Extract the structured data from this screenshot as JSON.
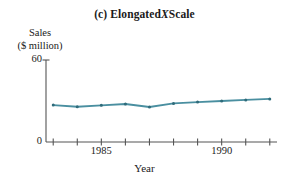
{
  "chart_data": {
    "type": "line",
    "title_parts": {
      "part_label": "(c)",
      "text_before_italic": "Elongated",
      "italic_text": "X",
      "text_after_italic": "Scale"
    },
    "xlabel": "Year",
    "ylabel": "Sales ($ million)",
    "ylabel_lines": [
      "Sales",
      "($ million)"
    ],
    "x": [
      1983,
      1984,
      1985,
      1986,
      1987,
      1988,
      1989,
      1990,
      1991,
      1992
    ],
    "values": [
      27.0,
      25.8,
      26.8,
      27.8,
      25.6,
      28.2,
      29.2,
      30.0,
      30.8,
      31.5
    ],
    "series": [
      {
        "name": "Sales",
        "values": [
          27.0,
          25.8,
          26.8,
          27.8,
          25.6,
          28.2,
          29.2,
          30.0,
          30.8,
          31.5
        ]
      }
    ],
    "xlim": [
      1982.7,
      1992.3
    ],
    "ylim": [
      0,
      63
    ],
    "yticks": [
      0,
      60
    ],
    "ytick_labels": [
      "0",
      "60"
    ],
    "xticks": [
      1983,
      1984,
      1985,
      1986,
      1987,
      1988,
      1989,
      1990,
      1991,
      1992
    ],
    "xtick_labels_shown": [
      {
        "value": 1985,
        "label": "1985"
      },
      {
        "value": 1990,
        "label": "1990"
      }
    ],
    "grid": false,
    "legend": null,
    "legend_position": "none",
    "line_color": "#4a8fa0",
    "marker": "dot",
    "marker_color": "#2f6b7a",
    "axis_color": "#555555",
    "background_color": "#ffffff",
    "text_color": "#1a1a1a"
  }
}
